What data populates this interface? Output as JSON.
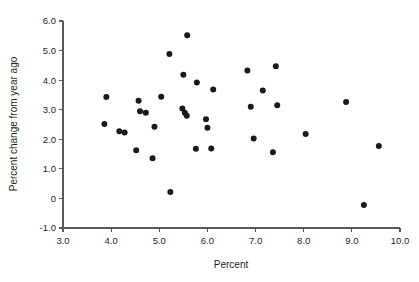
{
  "chart_data": {
    "type": "scatter",
    "title": "",
    "subtitle": "",
    "xlabel": "Percent",
    "ylabel": "Percent change from year ago",
    "xlim": [
      3.0,
      10.0
    ],
    "ylim": [
      -1.0,
      6.0
    ],
    "xticks": [
      3.0,
      4.0,
      5.0,
      6.0,
      7.0,
      8.0,
      9.0,
      10.0
    ],
    "xtick_labels": [
      "3.0",
      "4.0",
      "5.0",
      "6.0",
      "7.0",
      "8.0",
      "9.0",
      "10.0"
    ],
    "yticks": [
      -1.0,
      0.0,
      1.0,
      2.0,
      3.0,
      4.0,
      5.0,
      6.0
    ],
    "ytick_labels": [
      "-1.0",
      "0",
      "1.0",
      "2.0",
      "3.0",
      "4.0",
      "5.0",
      "6.0"
    ],
    "grid": false,
    "legend": null,
    "legend_position": "none",
    "marker": "circle",
    "marker_color": "#1a1a1a",
    "marker_size": 4.2,
    "series": [
      {
        "name": "observations",
        "points": [
          [
            3.86,
            2.52
          ],
          [
            3.9,
            3.43
          ],
          [
            4.17,
            2.27
          ],
          [
            4.28,
            2.23
          ],
          [
            4.52,
            1.63
          ],
          [
            4.57,
            3.3
          ],
          [
            4.6,
            2.95
          ],
          [
            4.72,
            2.9
          ],
          [
            4.86,
            1.36
          ],
          [
            4.9,
            2.42
          ],
          [
            5.04,
            3.44
          ],
          [
            5.21,
            4.88
          ],
          [
            5.23,
            0.22
          ],
          [
            5.48,
            3.04
          ],
          [
            5.5,
            4.18
          ],
          [
            5.53,
            2.9
          ],
          [
            5.57,
            2.8
          ],
          [
            5.58,
            5.52
          ],
          [
            5.76,
            1.68
          ],
          [
            5.78,
            3.92
          ],
          [
            5.97,
            2.68
          ],
          [
            6.0,
            2.39
          ],
          [
            6.08,
            1.69
          ],
          [
            6.12,
            3.68
          ],
          [
            6.83,
            4.33
          ],
          [
            6.9,
            3.1
          ],
          [
            6.96,
            2.03
          ],
          [
            7.15,
            3.65
          ],
          [
            7.36,
            1.56
          ],
          [
            7.42,
            4.47
          ],
          [
            7.45,
            3.15
          ],
          [
            8.04,
            2.18
          ],
          [
            8.88,
            3.26
          ],
          [
            9.25,
            -0.22
          ],
          [
            9.56,
            1.77
          ]
        ]
      }
    ]
  },
  "axes": {
    "x_title": "Percent",
    "y_title": "Percent change from year ago"
  }
}
